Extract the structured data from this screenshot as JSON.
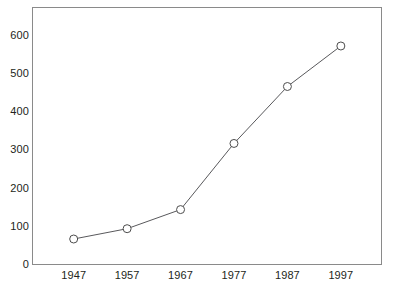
{
  "chart_data": {
    "type": "line",
    "title": "",
    "subtitle": "",
    "xlabel": "",
    "ylabel": "",
    "categories": [
      "1947",
      "1957",
      "1967",
      "1977",
      "1987",
      "1997"
    ],
    "x": [
      1947,
      1957,
      1967,
      1977,
      1987,
      1997
    ],
    "values": [
      68,
      95,
      145,
      318,
      467,
      573
    ],
    "series": [
      {
        "name": "",
        "values": [
          68,
          95,
          145,
          318,
          467,
          573
        ]
      }
    ],
    "ylim": [
      0,
      675
    ],
    "ytick_labels": [
      "0",
      "100",
      "200",
      "300",
      "400",
      "500",
      "600"
    ],
    "ytick_values": [
      0,
      100,
      200,
      300,
      400,
      500,
      600
    ],
    "xtick_labels": [
      "1947",
      "1957",
      "1967",
      "1977",
      "1987",
      "1997"
    ],
    "grid": false,
    "legend": false,
    "legend_position": "none",
    "marker": "open-circle",
    "line_color": "#59595c",
    "marker_fill": "#ffffff",
    "marker_stroke": "#4d4d4d",
    "frame_color": "#8a8a8a",
    "background_color": "#ffffff",
    "text_color": "#231f20"
  }
}
